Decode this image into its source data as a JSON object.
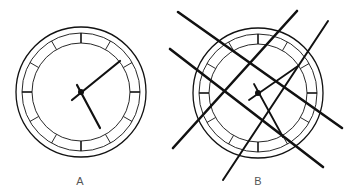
{
  "figure": {
    "background": "#ffffff",
    "ink_color": "#111111",
    "label_color": "#555555"
  },
  "clocks": [
    {
      "id": "A",
      "label": "A",
      "label_pos": [
        80,
        181
      ],
      "center": [
        81,
        92
      ],
      "outer_radius": 65,
      "middle_radius": 59,
      "inner_radius": 49,
      "tick_count": 12,
      "hands": [
        {
          "name": "minute-hand",
          "to": [
            120,
            61
          ],
          "tail": [
            72,
            100
          ],
          "width": 2.2
        },
        {
          "name": "hour-hand",
          "to": [
            100,
            128
          ],
          "tail": [
            77,
            85
          ],
          "width": 2.2
        }
      ],
      "occluders": []
    },
    {
      "id": "B",
      "label": "B",
      "label_pos": [
        258,
        181
      ],
      "center": [
        258,
        93
      ],
      "outer_radius": 65,
      "middle_radius": 59,
      "inner_radius": 49,
      "tick_count": 12,
      "hands": [
        {
          "name": "minute-hand",
          "to": [
            298,
            66
          ],
          "tail": [
            249,
            100
          ],
          "width": 1.8
        },
        {
          "name": "hour-hand",
          "to": [
            283,
            137
          ],
          "tail": [
            254,
            84
          ],
          "width": 1.8
        }
      ],
      "occluders": [
        {
          "from": [
            178,
            12
          ],
          "to": [
            342,
            128
          ],
          "width": 2.6
        },
        {
          "from": [
            170,
            49
          ],
          "to": [
            323,
            167
          ],
          "width": 2.6
        },
        {
          "from": [
            173,
            148
          ],
          "to": [
            297,
            11
          ],
          "width": 2.6
        },
        {
          "from": [
            223,
            180
          ],
          "to": [
            328,
            21
          ],
          "width": 2.0
        }
      ]
    }
  ]
}
